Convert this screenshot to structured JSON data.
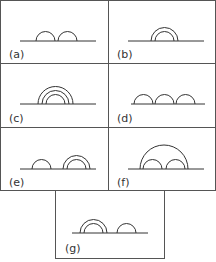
{
  "figure": {
    "panels": [
      {
        "id": "a",
        "label": "(a)",
        "description": "two adjacent small semicircles side by side"
      },
      {
        "id": "b",
        "label": "(b)",
        "description": "two concentric semicircles (nested)"
      },
      {
        "id": "c",
        "label": "(c)",
        "description": "three concentric semicircles (nested)"
      },
      {
        "id": "d",
        "label": "(d)",
        "description": "three adjacent small semicircles side by side"
      },
      {
        "id": "e",
        "label": "(e)",
        "description": "a single semicircle followed by two concentric semicircles"
      },
      {
        "id": "f",
        "label": "(f)",
        "description": "two adjacent small semicircles enclosed by one large semicircle"
      },
      {
        "id": "g",
        "label": "(g)",
        "description": "two concentric semicircles followed by a single semicircle"
      }
    ]
  },
  "colors": {
    "line": "#333333",
    "border": "#555555",
    "background": "#ffffff"
  }
}
